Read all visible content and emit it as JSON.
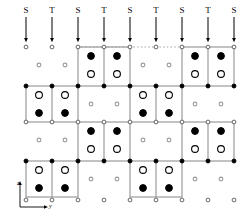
{
  "figure": {
    "kind": "lattice-structure-diagram",
    "width": 251,
    "height": 223,
    "background": "#ffffff",
    "ink": "#000000",
    "line_color": "#7a7a7a",
    "gray_fill": "#9a9a9a"
  },
  "column_headers": {
    "labels": [
      "S",
      "T",
      "S",
      "T",
      "S",
      "T",
      "S",
      "T",
      "S"
    ],
    "x": [
      26,
      52,
      78,
      104,
      130,
      156,
      182,
      208,
      234
    ],
    "label_y": 6,
    "arrow_top": 17,
    "arrow_bottom": 40
  },
  "dotted_line": {
    "y": 47,
    "x_start": 78,
    "x_end": 182,
    "color": "#9a9a9a"
  },
  "axes_indicator": {
    "origin_x": 20,
    "origin_y": 207,
    "vertical_length": 24,
    "horizontal_length": 26,
    "z_label": "z",
    "y_label": "y",
    "z_label_x": 17,
    "z_label_y": 180,
    "y_label_x": 49,
    "y_label_y": 203
  },
  "legend_note": {
    "large_open": "large open circle",
    "large_filled": "large filled circle",
    "small_open": "small open circle",
    "small_filled": "small filled circle",
    "small_gray": "small gray circle"
  },
  "chart_data": {
    "type": "scatter",
    "title": "",
    "xlabel": "y",
    "ylabel": "z",
    "grid": false,
    "legend": "none",
    "atoms": [
      {
        "x": 26,
        "y": 47,
        "style": "small_open"
      },
      {
        "x": 52,
        "y": 47,
        "style": "small_open"
      },
      {
        "x": 78,
        "y": 47,
        "style": "small_open"
      },
      {
        "x": 104,
        "y": 47,
        "style": "small_open"
      },
      {
        "x": 130,
        "y": 47,
        "style": "small_open"
      },
      {
        "x": 156,
        "y": 47,
        "style": "small_open"
      },
      {
        "x": 182,
        "y": 47,
        "style": "small_open"
      },
      {
        "x": 208,
        "y": 47,
        "style": "small_open"
      },
      {
        "x": 234,
        "y": 47,
        "style": "small_open"
      },
      {
        "x": 91,
        "y": 56,
        "style": "large_filled"
      },
      {
        "x": 117,
        "y": 56,
        "style": "large_filled"
      },
      {
        "x": 195,
        "y": 56,
        "style": "large_filled"
      },
      {
        "x": 221,
        "y": 56,
        "style": "large_filled"
      },
      {
        "x": 39,
        "y": 65,
        "style": "small_gray"
      },
      {
        "x": 65,
        "y": 65,
        "style": "small_gray"
      },
      {
        "x": 143,
        "y": 65,
        "style": "small_gray"
      },
      {
        "x": 169,
        "y": 65,
        "style": "small_gray"
      },
      {
        "x": 91,
        "y": 74,
        "style": "large_open"
      },
      {
        "x": 117,
        "y": 74,
        "style": "large_open"
      },
      {
        "x": 195,
        "y": 74,
        "style": "large_open"
      },
      {
        "x": 221,
        "y": 74,
        "style": "large_open"
      },
      {
        "x": 26,
        "y": 86,
        "style": "small_filled"
      },
      {
        "x": 52,
        "y": 86,
        "style": "small_filled"
      },
      {
        "x": 78,
        "y": 86,
        "style": "small_filled"
      },
      {
        "x": 104,
        "y": 86,
        "style": "small_filled"
      },
      {
        "x": 130,
        "y": 86,
        "style": "small_filled"
      },
      {
        "x": 156,
        "y": 86,
        "style": "small_filled"
      },
      {
        "x": 182,
        "y": 86,
        "style": "small_filled"
      },
      {
        "x": 208,
        "y": 86,
        "style": "small_filled"
      },
      {
        "x": 234,
        "y": 86,
        "style": "small_filled"
      },
      {
        "x": 39,
        "y": 95,
        "style": "large_open"
      },
      {
        "x": 65,
        "y": 95,
        "style": "large_open"
      },
      {
        "x": 143,
        "y": 95,
        "style": "large_open"
      },
      {
        "x": 169,
        "y": 95,
        "style": "large_open"
      },
      {
        "x": 91,
        "y": 104,
        "style": "small_gray"
      },
      {
        "x": 117,
        "y": 104,
        "style": "small_gray"
      },
      {
        "x": 195,
        "y": 104,
        "style": "small_gray"
      },
      {
        "x": 221,
        "y": 104,
        "style": "small_gray"
      },
      {
        "x": 39,
        "y": 113,
        "style": "large_filled"
      },
      {
        "x": 65,
        "y": 113,
        "style": "large_filled"
      },
      {
        "x": 143,
        "y": 113,
        "style": "large_filled"
      },
      {
        "x": 169,
        "y": 113,
        "style": "large_filled"
      },
      {
        "x": 26,
        "y": 122,
        "style": "small_open"
      },
      {
        "x": 52,
        "y": 122,
        "style": "small_open"
      },
      {
        "x": 78,
        "y": 122,
        "style": "small_open"
      },
      {
        "x": 104,
        "y": 122,
        "style": "small_open"
      },
      {
        "x": 130,
        "y": 122,
        "style": "small_open"
      },
      {
        "x": 156,
        "y": 122,
        "style": "small_open"
      },
      {
        "x": 182,
        "y": 122,
        "style": "small_open"
      },
      {
        "x": 208,
        "y": 122,
        "style": "small_open"
      },
      {
        "x": 234,
        "y": 122,
        "style": "small_open"
      },
      {
        "x": 91,
        "y": 131,
        "style": "large_filled"
      },
      {
        "x": 117,
        "y": 131,
        "style": "large_filled"
      },
      {
        "x": 195,
        "y": 131,
        "style": "large_filled"
      },
      {
        "x": 221,
        "y": 131,
        "style": "large_filled"
      },
      {
        "x": 39,
        "y": 140,
        "style": "small_gray"
      },
      {
        "x": 65,
        "y": 140,
        "style": "small_gray"
      },
      {
        "x": 143,
        "y": 140,
        "style": "small_gray"
      },
      {
        "x": 169,
        "y": 140,
        "style": "small_gray"
      },
      {
        "x": 91,
        "y": 149,
        "style": "large_open"
      },
      {
        "x": 117,
        "y": 149,
        "style": "large_open"
      },
      {
        "x": 195,
        "y": 149,
        "style": "large_open"
      },
      {
        "x": 221,
        "y": 149,
        "style": "large_open"
      },
      {
        "x": 26,
        "y": 161,
        "style": "small_filled"
      },
      {
        "x": 52,
        "y": 161,
        "style": "small_filled"
      },
      {
        "x": 78,
        "y": 161,
        "style": "small_filled"
      },
      {
        "x": 104,
        "y": 161,
        "style": "small_filled"
      },
      {
        "x": 130,
        "y": 161,
        "style": "small_filled"
      },
      {
        "x": 156,
        "y": 161,
        "style": "small_filled"
      },
      {
        "x": 182,
        "y": 161,
        "style": "small_filled"
      },
      {
        "x": 208,
        "y": 161,
        "style": "small_filled"
      },
      {
        "x": 234,
        "y": 161,
        "style": "small_filled"
      },
      {
        "x": 39,
        "y": 170,
        "style": "large_open"
      },
      {
        "x": 65,
        "y": 170,
        "style": "large_open"
      },
      {
        "x": 143,
        "y": 170,
        "style": "large_open"
      },
      {
        "x": 169,
        "y": 170,
        "style": "large_open"
      },
      {
        "x": 91,
        "y": 179,
        "style": "small_gray"
      },
      {
        "x": 117,
        "y": 179,
        "style": "small_gray"
      },
      {
        "x": 195,
        "y": 179,
        "style": "small_gray"
      },
      {
        "x": 221,
        "y": 179,
        "style": "small_gray"
      },
      {
        "x": 39,
        "y": 188,
        "style": "large_filled"
      },
      {
        "x": 65,
        "y": 188,
        "style": "large_filled"
      },
      {
        "x": 143,
        "y": 188,
        "style": "large_filled"
      },
      {
        "x": 169,
        "y": 188,
        "style": "large_filled"
      },
      {
        "x": 26,
        "y": 200,
        "style": "small_open"
      },
      {
        "x": 52,
        "y": 200,
        "style": "small_open"
      },
      {
        "x": 78,
        "y": 200,
        "style": "small_open"
      },
      {
        "x": 104,
        "y": 200,
        "style": "small_open"
      },
      {
        "x": 130,
        "y": 200,
        "style": "small_open"
      },
      {
        "x": 156,
        "y": 200,
        "style": "small_open"
      },
      {
        "x": 182,
        "y": 200,
        "style": "small_open"
      },
      {
        "x": 208,
        "y": 200,
        "style": "small_open"
      },
      {
        "x": 234,
        "y": 200,
        "style": "small_open"
      }
    ],
    "cells": [
      {
        "x1": 78,
        "y1": 47,
        "x2": 130,
        "y2": 86,
        "mid": 104
      },
      {
        "x1": 182,
        "y1": 47,
        "x2": 234,
        "y2": 86,
        "mid": 208
      },
      {
        "x1": 26,
        "y1": 86,
        "x2": 78,
        "y2": 122,
        "mid": 52
      },
      {
        "x1": 130,
        "y1": 86,
        "x2": 182,
        "y2": 122,
        "mid": 156
      },
      {
        "x1": 78,
        "y1": 122,
        "x2": 130,
        "y2": 161,
        "mid": 104
      },
      {
        "x1": 182,
        "y1": 122,
        "x2": 234,
        "y2": 161,
        "mid": 208
      },
      {
        "x1": 26,
        "y1": 161,
        "x2": 78,
        "y2": 197,
        "mid": 52
      },
      {
        "x1": 130,
        "y1": 161,
        "x2": 182,
        "y2": 197,
        "mid": 156
      }
    ]
  }
}
